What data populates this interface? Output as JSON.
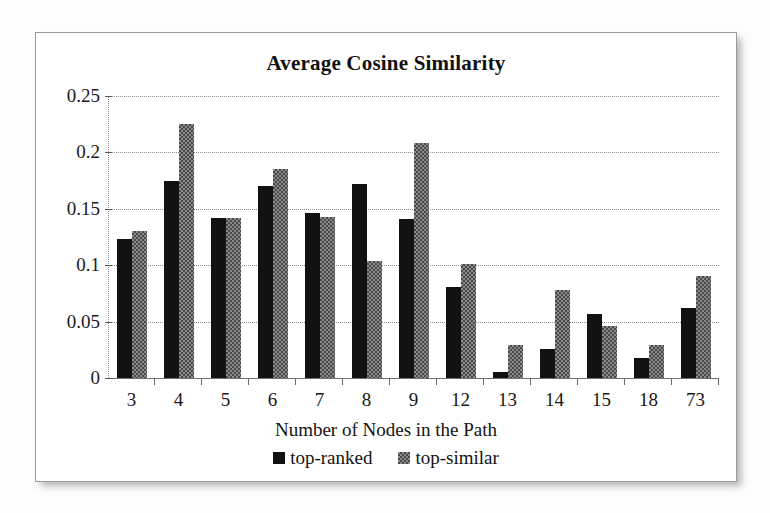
{
  "chart_data": {
    "type": "bar",
    "title": "Average Cosine Similarity",
    "xlabel": "Number of Nodes in the Path",
    "ylabel": "",
    "ylim": [
      0,
      0.25
    ],
    "yticks": [
      "0",
      "0.05",
      "0.1",
      "0.15",
      "0.2",
      "0.25"
    ],
    "ytick_values": [
      0,
      0.05,
      0.1,
      0.15,
      0.2,
      0.25
    ],
    "grid": true,
    "legend_position": "bottom",
    "categories": [
      "3",
      "4",
      "5",
      "6",
      "7",
      "8",
      "9",
      "12",
      "13",
      "14",
      "15",
      "18",
      "73"
    ],
    "series": [
      {
        "name": "top-ranked",
        "color": "#121212",
        "values": [
          0.123,
          0.175,
          0.142,
          0.17,
          0.146,
          0.172,
          0.141,
          0.081,
          0.005,
          0.026,
          0.057,
          0.018,
          0.062
        ]
      },
      {
        "name": "top-similar",
        "color": "#8a8a8a",
        "values": [
          0.13,
          0.225,
          0.142,
          0.185,
          0.143,
          0.104,
          0.208,
          0.101,
          0.029,
          0.078,
          0.046,
          0.029,
          0.09
        ]
      }
    ]
  },
  "legend": {
    "items": [
      {
        "label": "top-ranked",
        "swatch": "black-square-icon"
      },
      {
        "label": "top-similar",
        "swatch": "gray-hatched-square-icon"
      }
    ]
  }
}
